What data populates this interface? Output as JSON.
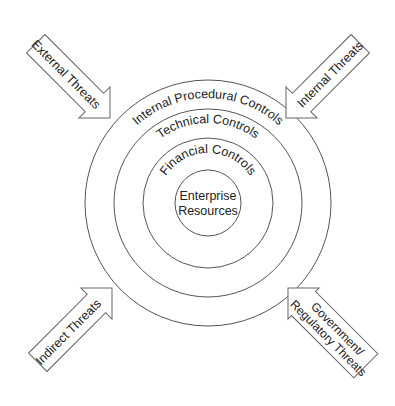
{
  "diagram": {
    "rings": [
      {
        "label": "Internal Procedural Controls",
        "r": 123
      },
      {
        "label": "Technical Controls",
        "r": 94
      },
      {
        "label": "Financial Controls",
        "r": 65
      },
      {
        "label_lines": [
          "Enterprise",
          "Resources"
        ],
        "r": 33
      }
    ],
    "threats": {
      "top_left": {
        "label": "External Threats"
      },
      "top_right": {
        "label": "Internal Threats"
      },
      "bottom_left": {
        "label": "Indirect Threats"
      },
      "bottom_right": {
        "label_lines": [
          "Government/",
          "Regulatory Threats"
        ]
      }
    },
    "colors": {
      "stroke": "#555555",
      "text": "#222222",
      "background": "#ffffff"
    }
  }
}
